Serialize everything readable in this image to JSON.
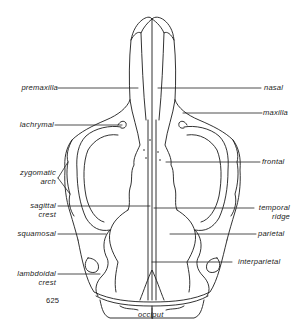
{
  "figure": {
    "number": "625",
    "labels": {
      "premaxilla": "premaxilla",
      "nasal": "nasal",
      "lachrymal": "lachrymal",
      "maxilla": "maxilla",
      "zygomatic_arch_line1": "zygomatic",
      "zygomatic_arch_line2": "arch",
      "frontal": "frontal",
      "sagittal_crest_line1": "sagittal",
      "sagittal_crest_line2": "crest",
      "temporal_ridge_line1": "temporal",
      "temporal_ridge_line2": "ridge",
      "squamosal": "squamosal",
      "parietal": "parietal",
      "interparietal": "interparietal",
      "lambdoidal_crest_line1": "lambdoidal",
      "lambdoidal_crest_line2": "crest",
      "occiput": "occiput"
    },
    "colors": {
      "ink": "#1c1c1c",
      "background": "#ffffff"
    }
  }
}
